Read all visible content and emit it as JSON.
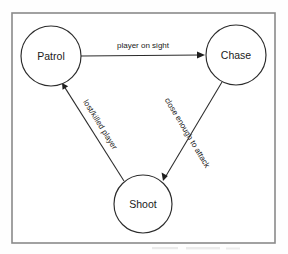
{
  "diagram": {
    "type": "finite-state-machine",
    "title": "",
    "background_color": "#ffffff",
    "ink_color": "#1f1f1f",
    "frame": {
      "stroke_color": "#8a8a8a",
      "x": 12,
      "y": 13,
      "width": 263,
      "height": 230
    },
    "nodes": [
      {
        "id": "patrol",
        "label": "Patrol",
        "cx": 51,
        "cy": 56,
        "r": 30
      },
      {
        "id": "chase",
        "label": "Chase",
        "cx": 236,
        "cy": 55,
        "r": 30
      },
      {
        "id": "shoot",
        "label": "Shoot",
        "cx": 143,
        "cy": 204,
        "r": 29
      }
    ],
    "edges": [
      {
        "id": "patrol-to-chase",
        "from": "patrol",
        "to": "chase",
        "label": "player on sight",
        "x1": 81,
        "y1": 56,
        "x2": 205,
        "y2": 55,
        "label_x": 143,
        "label_y": 48,
        "label_rotation": 0
      },
      {
        "id": "chase-to-shoot",
        "from": "chase",
        "to": "shoot",
        "label": "close enough to attack",
        "x1": 222,
        "y1": 82,
        "x2": 163,
        "y2": 181,
        "label_x": 185,
        "label_y": 134,
        "label_rotation": 59
      },
      {
        "id": "shoot-to-patrol",
        "from": "shoot",
        "to": "patrol",
        "label": "lost/killed player",
        "x1": 124,
        "y1": 181,
        "x2": 62,
        "y2": 83,
        "label_x": 98,
        "label_y": 126,
        "label_rotation": 58
      }
    ]
  }
}
